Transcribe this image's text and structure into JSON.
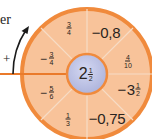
{
  "diagram": {
    "left_labels": {
      "word_fragment": "er",
      "plus_sign": "+"
    },
    "center": {
      "whole": "2",
      "numerator": "1",
      "denominator": "2"
    },
    "segments": [
      {
        "id": "top-left",
        "sign": "",
        "whole": "",
        "numerator": "3",
        "denominator": "4",
        "decimal": ""
      },
      {
        "id": "top-right",
        "decimal": "−0,8"
      },
      {
        "id": "right-upper",
        "sign": "",
        "whole": "",
        "numerator": "4",
        "denominator": "10",
        "decimal": ""
      },
      {
        "id": "right-lower",
        "sign": "−",
        "whole": "3",
        "numerator": "1",
        "denominator": "2",
        "decimal": ""
      },
      {
        "id": "bottom-right",
        "decimal": "−0,75"
      },
      {
        "id": "bottom-left",
        "sign": "",
        "whole": "",
        "numerator": "1",
        "denominator": "3",
        "decimal": ""
      },
      {
        "id": "left-lower",
        "sign": "−",
        "whole": "",
        "numerator": "5",
        "denominator": "6",
        "decimal": ""
      },
      {
        "id": "left-upper",
        "sign": "−",
        "whole": "",
        "numerator": "3",
        "denominator": "4",
        "decimal": ""
      }
    ],
    "colors": {
      "wheel_fill": "#f8c39a",
      "wheel_border": "#f08a3c",
      "divider": "#f4d8c0",
      "center_fill": "#c3c8e8",
      "center_border": "#f08a3c",
      "axis_line": "#ea7a2a",
      "arrow": "#1a1a1a"
    }
  }
}
